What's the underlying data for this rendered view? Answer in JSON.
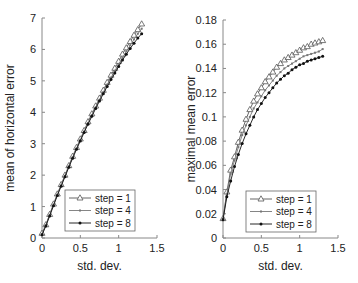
{
  "chart_data": [
    {
      "type": "line",
      "title": "",
      "xlabel": "std. dev.",
      "ylabel": "mean of horizontal error",
      "xlim": [
        0,
        1.5
      ],
      "ylim": [
        0,
        7
      ],
      "xticks": [
        0,
        0.5,
        1,
        1.5
      ],
      "xtick_labels": [
        "0",
        "0.5",
        "1",
        "1.5"
      ],
      "yticks": [
        0,
        1,
        2,
        3,
        4,
        5,
        6,
        7
      ],
      "ytick_labels": [
        "0",
        "1",
        "2",
        "3",
        "4",
        "5",
        "6",
        "7"
      ],
      "grid": false,
      "legend_position": "lower right",
      "x": [
        0,
        0.05,
        0.1,
        0.15,
        0.2,
        0.25,
        0.3,
        0.35,
        0.4,
        0.45,
        0.5,
        0.55,
        0.6,
        0.65,
        0.7,
        0.75,
        0.8,
        0.85,
        0.9,
        0.95,
        1.0,
        1.05,
        1.1,
        1.15,
        1.2,
        1.25,
        1.3
      ],
      "series": [
        {
          "name": "step = 1",
          "marker": "triangle-open",
          "values": [
            0.15,
            0.42,
            0.75,
            1.08,
            1.4,
            1.7,
            2.0,
            2.3,
            2.6,
            2.88,
            3.15,
            3.42,
            3.7,
            3.95,
            4.2,
            4.45,
            4.7,
            4.95,
            5.18,
            5.4,
            5.62,
            5.85,
            6.05,
            6.25,
            6.45,
            6.63,
            6.81
          ]
        },
        {
          "name": "step = 4",
          "marker": "x-small",
          "values": [
            0.12,
            0.4,
            0.73,
            1.06,
            1.38,
            1.68,
            1.98,
            2.28,
            2.57,
            2.85,
            3.12,
            3.39,
            3.66,
            3.91,
            4.16,
            4.4,
            4.64,
            4.88,
            5.1,
            5.32,
            5.53,
            5.74,
            5.94,
            6.13,
            6.32,
            6.5,
            6.66
          ]
        },
        {
          "name": "step = 8",
          "marker": "dot",
          "values": [
            0.1,
            0.38,
            0.7,
            1.03,
            1.35,
            1.65,
            1.95,
            2.25,
            2.54,
            2.82,
            3.09,
            3.36,
            3.62,
            3.87,
            4.12,
            4.36,
            4.59,
            4.82,
            5.04,
            5.25,
            5.46,
            5.66,
            5.85,
            6.03,
            6.2,
            6.36,
            6.5
          ]
        }
      ]
    },
    {
      "type": "line",
      "title": "",
      "xlabel": "std. dev.",
      "ylabel": "maximal mean error",
      "xlim": [
        0,
        1.5
      ],
      "ylim": [
        0,
        0.18
      ],
      "xticks": [
        0,
        0.5,
        1,
        1.5
      ],
      "xtick_labels": [
        "0",
        "0.5",
        "1",
        "1.5"
      ],
      "yticks": [
        0,
        0.02,
        0.04,
        0.06,
        0.08,
        0.1,
        0.12,
        0.14,
        0.16,
        0.18
      ],
      "ytick_labels": [
        "0",
        "0.02",
        "0.04",
        "0.06",
        "0.08",
        "0.1",
        "0.12",
        "0.14",
        "0.16",
        "0.18"
      ],
      "grid": false,
      "legend_position": "lower right",
      "x": [
        0,
        0.05,
        0.1,
        0.15,
        0.2,
        0.25,
        0.3,
        0.35,
        0.4,
        0.45,
        0.5,
        0.55,
        0.6,
        0.65,
        0.7,
        0.75,
        0.8,
        0.85,
        0.9,
        0.95,
        1.0,
        1.05,
        1.1,
        1.15,
        1.2,
        1.25,
        1.3
      ],
      "series": [
        {
          "name": "step = 1",
          "marker": "triangle-open",
          "values": [
            0.016,
            0.038,
            0.056,
            0.067,
            0.079,
            0.089,
            0.098,
            0.106,
            0.113,
            0.119,
            0.124,
            0.129,
            0.133,
            0.137,
            0.141,
            0.144,
            0.147,
            0.149,
            0.151,
            0.153,
            0.155,
            0.157,
            0.158,
            0.16,
            0.161,
            0.162,
            0.163
          ]
        },
        {
          "name": "step = 4",
          "marker": "x-small",
          "values": [
            0.016,
            0.036,
            0.053,
            0.064,
            0.075,
            0.085,
            0.093,
            0.1,
            0.107,
            0.112,
            0.117,
            0.122,
            0.126,
            0.13,
            0.134,
            0.137,
            0.14,
            0.142,
            0.144,
            0.146,
            0.148,
            0.15,
            0.151,
            0.152,
            0.153,
            0.154,
            0.156
          ]
        },
        {
          "name": "step = 8",
          "marker": "dot",
          "values": [
            0.015,
            0.034,
            0.047,
            0.059,
            0.069,
            0.078,
            0.086,
            0.093,
            0.1,
            0.106,
            0.111,
            0.116,
            0.12,
            0.124,
            0.128,
            0.131,
            0.134,
            0.136,
            0.139,
            0.141,
            0.143,
            0.144,
            0.146,
            0.147,
            0.148,
            0.149,
            0.15
          ]
        }
      ]
    }
  ]
}
